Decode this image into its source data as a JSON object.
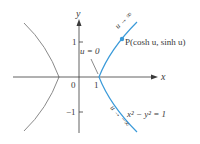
{
  "figure": {
    "type": "hyperbola-parametrization",
    "axes": {
      "x_label": "x",
      "y_label": "y",
      "x_ticks": [
        {
          "value": 0,
          "label": "0"
        },
        {
          "value": 1,
          "label": "1"
        }
      ],
      "y_ticks": [
        {
          "value": 1,
          "label": "1"
        },
        {
          "value": -1,
          "label": "−1"
        }
      ]
    },
    "curves": {
      "equation_label": "x² − y² = 1",
      "right_branch_color": "#3a9ad9",
      "left_branch_color": "#8a8a8a"
    },
    "annotations": {
      "point_label": "P(cosh u, sinh u)",
      "vertex_label": "u = 0",
      "upper_arrow_label": "u → ∞",
      "lower_arrow_label": "u → −∞"
    },
    "colors": {
      "axis": "#3a3a3a",
      "point": "#3a9ad9"
    }
  }
}
